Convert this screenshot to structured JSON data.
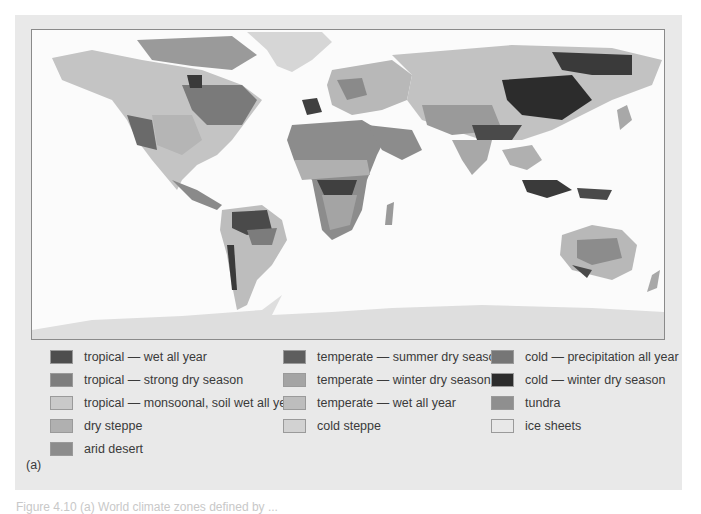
{
  "figure": {
    "label": "(a)",
    "caption": "Figure 4.10   (a) World climate zones defined by ..."
  },
  "map": {
    "title": "World climate zones map",
    "projection": "equirectangular world map"
  },
  "legend": {
    "columns": [
      [
        {
          "label": "tropical — wet all year",
          "color": "#4e4e4e"
        },
        {
          "label": "tropical — strong dry season",
          "color": "#7e7e7e"
        },
        {
          "label": "tropical — monsoonal, soil wet all year",
          "color": "#c9c9c9"
        },
        {
          "label": "dry steppe",
          "color": "#b0b0b0"
        },
        {
          "label": "arid desert",
          "color": "#8c8c8c"
        }
      ],
      [
        {
          "label": "temperate — summer dry season",
          "color": "#5e5e5e"
        },
        {
          "label": "temperate — winter dry season",
          "color": "#a4a4a4"
        },
        {
          "label": "temperate — wet all year",
          "color": "#bdbdbd"
        },
        {
          "label": "cold steppe",
          "color": "#d2d2d2"
        }
      ],
      [
        {
          "label": "cold — precipitation all year",
          "color": "#767676"
        },
        {
          "label": "cold — winter dry season",
          "color": "#2c2c2c"
        },
        {
          "label": "tundra",
          "color": "#8f8f8f"
        },
        {
          "label": "ice sheets",
          "color": "#e8e8e8"
        }
      ]
    ]
  }
}
